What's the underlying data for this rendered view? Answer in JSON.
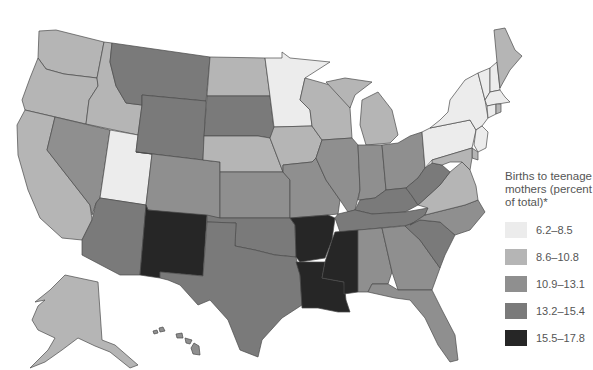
{
  "map": {
    "title": "Births to teenage mothers by state",
    "legend": {
      "title": "Births to teenage mothers (percent of total)*",
      "bins": [
        {
          "label": "6.2–8.5",
          "color": "#ececec"
        },
        {
          "label": "8.6–10.8",
          "color": "#b5b5b5"
        },
        {
          "label": "10.9–13.1",
          "color": "#8f8f8f"
        },
        {
          "label": "13.2–15.4",
          "color": "#7a7a7a"
        },
        {
          "label": "15.5–17.8",
          "color": "#262626"
        }
      ]
    },
    "states": {
      "WA": 1,
      "OR": 1,
      "CA": 1,
      "ID": 1,
      "NV": 2,
      "UT": 0,
      "AZ": 3,
      "MT": 3,
      "WY": 3,
      "CO": 2,
      "NM": 4,
      "ND": 1,
      "SD": 3,
      "NE": 1,
      "KS": 2,
      "OK": 3,
      "TX": 3,
      "MN": 0,
      "IA": 1,
      "MO": 2,
      "AR": 4,
      "LA": 4,
      "WI": 1,
      "IL": 2,
      "MI": 1,
      "IN": 2,
      "OH": 2,
      "KY": 3,
      "TN": 3,
      "MS": 4,
      "AL": 2,
      "GA": 2,
      "FL": 2,
      "SC": 3,
      "NC": 2,
      "VA": 1,
      "WV": 3,
      "PA": 0,
      "NY": 0,
      "VT": 0,
      "NH": 0,
      "ME": 1,
      "MA": 0,
      "CT": 0,
      "RI": 1,
      "NJ": 0,
      "DE": 1,
      "MD": 1,
      "AK": 1,
      "HI": 2
    }
  }
}
